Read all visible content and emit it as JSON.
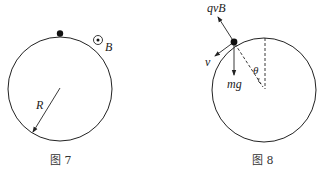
{
  "figures": [
    {
      "caption": "图 7",
      "labels": {
        "field": "B",
        "radius": "R"
      },
      "elements": [
        "circle",
        "ball-at-top",
        "magnetic-field-out-of-page-symbol",
        "radius-arrow"
      ]
    },
    {
      "caption": "图 8",
      "labels": {
        "lorentz_force": "qvB",
        "velocity": "v",
        "gravity": "mg",
        "angle": "θ"
      },
      "elements": [
        "circle",
        "ball-on-circle",
        "force-arrows",
        "dashed-radius",
        "dashed-vertical",
        "angle-arc"
      ]
    }
  ],
  "colors": {
    "line": "#222222",
    "background": "#ffffff"
  }
}
